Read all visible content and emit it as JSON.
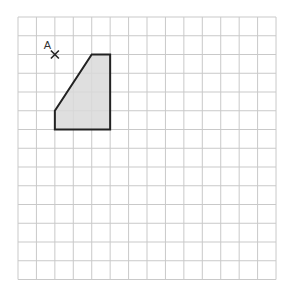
{
  "grid": {
    "origin_x": 18,
    "origin_y": 17,
    "cols": 14,
    "rows": 14,
    "cell_w": 18.43,
    "cell_h": 18.75,
    "line_color": "#c9c9c9"
  },
  "shape": {
    "name": "shaded-quadrilateral",
    "fill": "#d9d9d9",
    "stroke": "#222222",
    "vertices": [
      [
        4,
        2
      ],
      [
        5,
        2
      ],
      [
        5,
        6
      ],
      [
        2,
        6
      ],
      [
        2,
        5
      ]
    ]
  },
  "point": {
    "label": "A",
    "col": 2,
    "row": 2,
    "marker": "cross"
  }
}
